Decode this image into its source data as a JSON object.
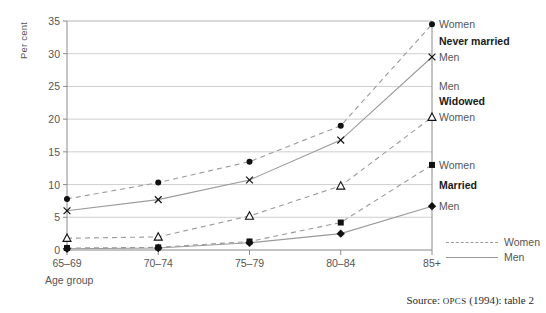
{
  "chart_data": {
    "type": "line",
    "title": "",
    "xlabel": "Age group",
    "ylabel": "Per cent",
    "categories": [
      "65–69",
      "70–74",
      "75–79",
      "80–84",
      "85+"
    ],
    "ylim": [
      0,
      35
    ],
    "yticks": [
      0,
      5,
      10,
      15,
      20,
      25,
      30,
      35
    ],
    "grid": true,
    "legend_position": "right",
    "series": [
      {
        "name": "Never married Women",
        "group": "Never married",
        "sex": "Women",
        "marker": "circle",
        "line": "dashed",
        "values": [
          7.8,
          10.3,
          13.5,
          19.0,
          34.5
        ]
      },
      {
        "name": "Never married Men",
        "group": "Never married",
        "sex": "Men",
        "marker": "cross",
        "line": "solid",
        "values": [
          6.0,
          7.7,
          10.7,
          16.8,
          29.5
        ]
      },
      {
        "name": "Widowed Women",
        "group": "Widowed",
        "sex": "Women",
        "marker": "triangle",
        "line": "dashed",
        "values": [
          1.8,
          2.0,
          5.2,
          9.8,
          20.3
        ]
      },
      {
        "name": "Married Women",
        "group": "Married",
        "sex": "Women",
        "marker": "square",
        "line": "dashed",
        "values": [
          0.3,
          0.4,
          1.3,
          4.2,
          13.0
        ]
      },
      {
        "name": "Married Men",
        "group": "Married",
        "sex": "Men",
        "marker": "diamond",
        "line": "solid",
        "values": [
          0.2,
          0.3,
          1.1,
          2.5,
          6.7
        ]
      }
    ],
    "right_labels": [
      {
        "text": "Women",
        "value": 34.5,
        "bold": false
      },
      {
        "text": "Never married",
        "value": 32.0,
        "bold": true
      },
      {
        "text": "Men",
        "value": 29.5,
        "bold": false
      },
      {
        "text": "Men",
        "value": 25.0,
        "bold": false
      },
      {
        "text": "Widowed",
        "value": 22.7,
        "bold": true
      },
      {
        "text": "Women",
        "value": 20.3,
        "bold": false
      },
      {
        "text": "Women",
        "value": 13.0,
        "bold": false
      },
      {
        "text": "Married",
        "value": 10.0,
        "bold": true
      },
      {
        "text": "Men",
        "value": 6.7,
        "bold": false
      }
    ],
    "legend": [
      {
        "label": "Women",
        "line": "dashed"
      },
      {
        "label": "Men",
        "line": "solid"
      }
    ],
    "source_prefix": "Source: ",
    "source_smallcaps": "OPCS",
    "source_suffix": " (1994): table 2",
    "colors": {
      "line": "#9a9a9a",
      "grid": "#c9c9c9",
      "axis": "#8a8a8a",
      "marker": "#111111",
      "text": "#555555",
      "bold_text": "#1a1a1a"
    }
  }
}
